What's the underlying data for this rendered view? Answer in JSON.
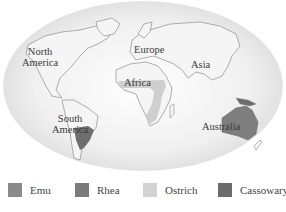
{
  "map": {
    "continent_labels": {
      "north_america": [
        "North",
        "America"
      ],
      "europe": "Europe",
      "asia": "Asia",
      "africa": "Africa",
      "south_america": [
        "South",
        "America"
      ],
      "australia": "Australia"
    }
  },
  "legend": {
    "items": [
      {
        "label": "Emu",
        "color": "#8a8a8a"
      },
      {
        "label": "Rhea",
        "color": "#7a7a7a"
      },
      {
        "label": "Ostrich",
        "color": "#d2d2d2"
      },
      {
        "label": "Cassowary",
        "color": "#6c6c6c"
      }
    ]
  },
  "colors": {
    "land": "#f2f2f2",
    "coast": "#8c8c8c",
    "globe_shade": "#dcdcdc",
    "emu_range": "#8a8a8a",
    "rhea_range": "#6e6e6e",
    "ostrich_range": "#cfcfcf"
  }
}
